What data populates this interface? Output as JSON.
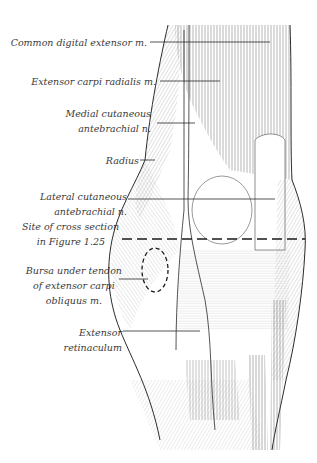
{
  "figure": {
    "labels": [
      {
        "id": "common-digital-extensor",
        "lines": [
          "Common digital extensor m."
        ]
      },
      {
        "id": "extensor-carpi-radialis",
        "lines": [
          "Extensor carpi radialis m."
        ]
      },
      {
        "id": "medial-cutaneous-antebrachial",
        "lines": [
          "Medial cutaneous",
          "antebrachial n."
        ]
      },
      {
        "id": "radius",
        "lines": [
          "Radius"
        ]
      },
      {
        "id": "lateral-cutaneous-antebrachial",
        "lines": [
          "Lateral cutaneous",
          "antebrachial n."
        ]
      },
      {
        "id": "cross-section-site",
        "lines": [
          "Site of cross section",
          "in Figure 1.25"
        ]
      },
      {
        "id": "bursa-extensor-carpi-obliquus",
        "lines": [
          "Bursa under tendon",
          "of extensor carpi",
          "obliquus m."
        ]
      },
      {
        "id": "extensor-retinaculum",
        "lines": [
          "Extensor",
          "retinaculum"
        ]
      }
    ]
  },
  "colors": {
    "ink": "#2a2a2a",
    "text": "#3a3a3a",
    "hatch": "#555555",
    "background": "#ffffff"
  }
}
